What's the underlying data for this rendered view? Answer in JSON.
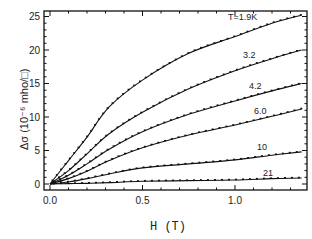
{
  "chart_data": {
    "type": "line",
    "title": "",
    "xlabel": "H (T)",
    "ylabel": "Δσ (10⁻⁶ mho/□)",
    "xlim": [
      -0.03,
      1.38
    ],
    "ylim": [
      -1,
      26
    ],
    "xticks": [
      "0.0",
      "0.5",
      "1.0"
    ],
    "yticks": [
      "0",
      "5",
      "10",
      "15",
      "20",
      "25"
    ],
    "grid": false,
    "legend": "inline labels at right end of curves",
    "x": [
      0.0,
      0.1,
      0.2,
      0.32,
      0.5,
      0.75,
      1.0,
      1.2,
      1.36
    ],
    "series": [
      {
        "name": "T=1.9K",
        "label": "T=1.9K",
        "values": [
          0.0,
          3.5,
          7.0,
          11.5,
          15.5,
          19.5,
          22.0,
          24.0,
          25.2
        ]
      },
      {
        "name": "3.2",
        "label": "3.2",
        "values": [
          0.0,
          2.0,
          4.5,
          7.5,
          10.7,
          14.2,
          16.9,
          18.7,
          20.0
        ]
      },
      {
        "name": "4.2",
        "label": "4.2",
        "values": [
          0.0,
          1.3,
          3.0,
          5.2,
          7.8,
          10.4,
          12.4,
          13.9,
          15.0
        ]
      },
      {
        "name": "6.0",
        "label": "6.0",
        "values": [
          0.0,
          0.8,
          1.9,
          3.5,
          5.4,
          7.3,
          8.8,
          10.1,
          11.2
        ]
      },
      {
        "name": "10",
        "label": "10",
        "values": [
          0.0,
          0.3,
          0.8,
          1.5,
          2.4,
          3.0,
          3.6,
          4.3,
          4.8
        ]
      },
      {
        "name": "21",
        "label": "21",
        "values": [
          0.0,
          0.05,
          0.1,
          0.2,
          0.4,
          0.5,
          0.6,
          0.8,
          0.9
        ]
      }
    ]
  }
}
